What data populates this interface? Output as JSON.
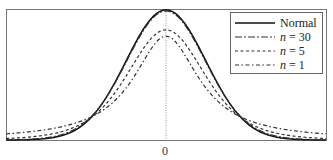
{
  "chart_data": {
    "type": "line",
    "title": "",
    "xlabel": "",
    "ylabel": "",
    "x_ticks": [
      "0"
    ],
    "xlim": [
      -4,
      4
    ],
    "grid": false,
    "legend_position": "upper right",
    "series": [
      {
        "name": "Normal",
        "style": "solid",
        "peak": 0.399
      },
      {
        "name": "n = 30",
        "style": "dash-dot-long",
        "peak": 0.396
      },
      {
        "name": "n = 5",
        "style": "dashed",
        "peak": 0.34
      },
      {
        "name": "n = 1",
        "style": "dash-dot",
        "peak": 0.318
      }
    ],
    "annotations": [
      "vertical dotted line at x = 0"
    ]
  },
  "legend": {
    "items": [
      {
        "label": "Normal"
      },
      {
        "label_n": "n",
        "label_rest": " = 30"
      },
      {
        "label_n": "n",
        "label_rest": " = 5"
      },
      {
        "label_n": "n",
        "label_rest": " = 1"
      }
    ]
  },
  "axis": {
    "tick_zero": "0"
  }
}
